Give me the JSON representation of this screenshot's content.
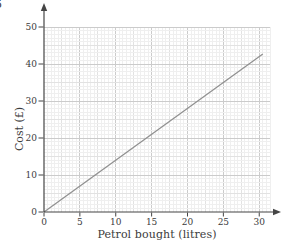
{
  "page": {
    "corner_label": "5"
  },
  "chart_data": {
    "type": "line",
    "title": "",
    "xlabel": "Petrol bought (litres)",
    "ylabel": "Cost (£)",
    "x_ticks": [
      0,
      5,
      10,
      15,
      20,
      25,
      30
    ],
    "y_ticks": [
      0,
      10,
      20,
      30,
      40,
      50
    ],
    "xlim": [
      0,
      31.5
    ],
    "ylim": [
      0,
      50
    ],
    "x_minor_step": 0.5,
    "x_medium_step": 2.5,
    "x_major_step": 5,
    "y_minor_step": 1,
    "y_medium_step": 5,
    "y_major_step": 10,
    "grid": true,
    "legend": false,
    "series": [
      {
        "name": "petrol-cost-line",
        "points": [
          [
            0,
            0
          ],
          [
            30.5,
            42.7
          ]
        ],
        "color": "#8f8f8f"
      }
    ],
    "colors": {
      "axis": "#454545",
      "text": "#3b3b3b",
      "grid_minor": "#efefef",
      "grid_medium": "#e2e2e2",
      "grid_major": "#cbcbcb",
      "background": "#ffffff"
    }
  }
}
